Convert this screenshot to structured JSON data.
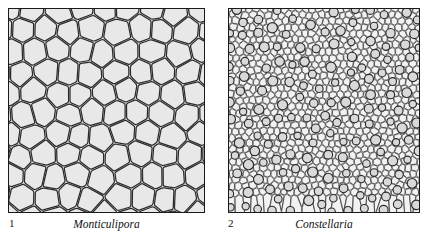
{
  "figure": {
    "background_color": "#ffffff",
    "panels": [
      {
        "number": "1",
        "genus": "Monticulipora",
        "texture_type": "coarse-polygonal-corallites",
        "border_color": "#1a1a1a",
        "cell_fill_color": "#e8e8e8",
        "cell_line_color": "#2b2b2b",
        "approx_cell_size_px": 24,
        "cell_count_estimate": 96
      },
      {
        "number": "2",
        "genus": "Constellaria",
        "texture_type": "fine-polygonal-with-scattered-large-zooecia",
        "border_color": "#1a1a1a",
        "cell_fill_color": "#f2f2f2",
        "cell_line_color": "#2b2b2b",
        "large_circle_fill_color": "#d9d9d9",
        "approx_cell_size_px": 7,
        "cell_count_estimate": 760,
        "large_circle_count_estimate": 120
      }
    ]
  }
}
